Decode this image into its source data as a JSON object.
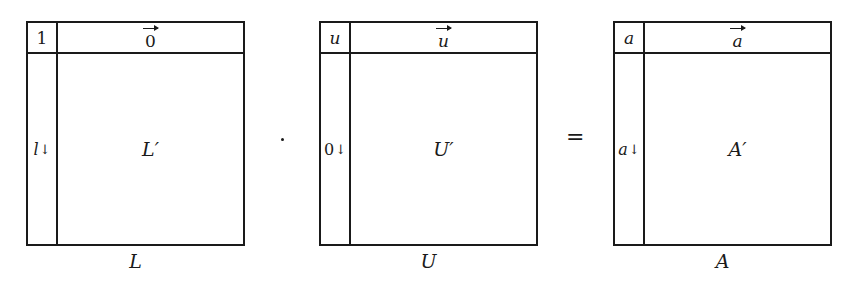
{
  "diagram": {
    "matrices": [
      {
        "id": "L",
        "caption": "L",
        "corner": "1",
        "row_vector": "0",
        "column": "l",
        "column_arrow": "↓",
        "body": "L′"
      },
      {
        "id": "U",
        "caption": "U",
        "corner": "u",
        "row_vector": "u",
        "column": "0",
        "column_arrow": "↓",
        "body": "U′"
      },
      {
        "id": "A",
        "caption": "A",
        "corner": "a",
        "row_vector": "a",
        "column": "a",
        "column_arrow": "↓",
        "body": "A′"
      }
    ],
    "operators": {
      "multiply": "·",
      "equals": "="
    }
  }
}
